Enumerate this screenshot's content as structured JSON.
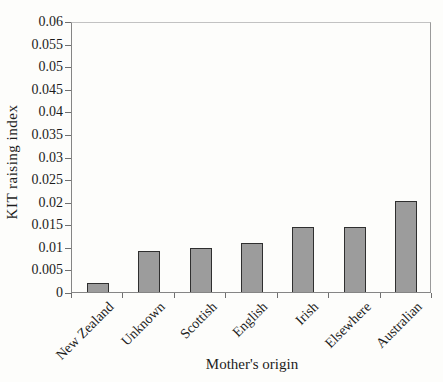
{
  "figure": {
    "background": "#fdfdfb"
  },
  "chart_data": {
    "type": "bar",
    "title": "",
    "categories": [
      "New Zealand",
      "Unknown",
      "Scottish",
      "English",
      "Irish",
      "Elsewhere",
      "Australian"
    ],
    "values": [
      0.002,
      0.009,
      0.0097,
      0.0108,
      0.0145,
      0.0145,
      0.0202
    ],
    "xlabel": "Mother's origin",
    "ylabel": "KIT raising index",
    "ylim": [
      0,
      0.06
    ],
    "ytick_step": 0.005,
    "ytick_labels": [
      "0",
      "0.005",
      "0.01",
      "0.015",
      "0.02",
      "0.025",
      "0.03",
      "0.035",
      "0.04",
      "0.045",
      "0.05",
      "0.055",
      "0.06"
    ],
    "grid": false,
    "legend": null,
    "bar_fill": "#9c9c9c",
    "bar_border": "#2f2f2f",
    "axis_color": "#6f6f6f",
    "text_color": "#1c1c1c"
  }
}
